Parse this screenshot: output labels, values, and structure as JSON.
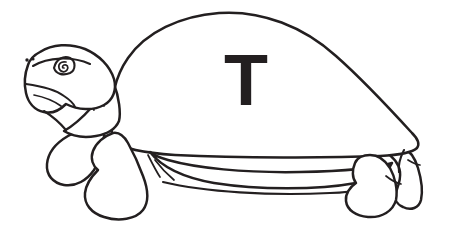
{
  "image": {
    "title": "Turtle Coloring Page Line Art",
    "subject": "turtle",
    "style": "black-and-white line art",
    "background_color": "#ffffff",
    "ink_color": "#231f20",
    "width": 452,
    "height": 249
  },
  "shell": {
    "letter": "T",
    "letter_color": "#231f20",
    "letter_left_px": 224,
    "letter_top_px": 44,
    "letter_font_size_px": 72
  },
  "parts": {
    "shell_label": "shell-carapace",
    "plastron_label": "plastron-belly",
    "head_label": "head",
    "eye_label": "eye",
    "pupil_label": "spiral-pupil",
    "nostril_label": "nostril",
    "mouth_label": "mouth",
    "neck_label": "neck",
    "front_leg_near_label": "front-leg-near",
    "front_leg_far_label": "front-leg-far",
    "rear_leg_near_label": "rear-leg-near",
    "rear_leg_far_label": "rear-leg-far",
    "tail_label": "tail"
  }
}
